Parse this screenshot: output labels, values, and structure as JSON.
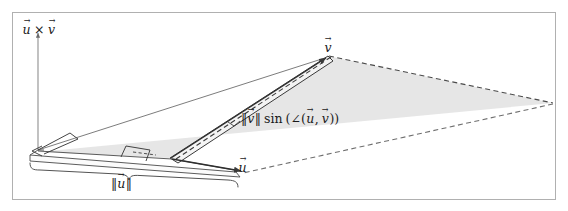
{
  "figure": {
    "frame": {
      "border_color": "#b0b0b0",
      "background_color": "#ffffff"
    },
    "palette": {
      "plane_fill": "#dcdcdc",
      "blade_fill": "#f2f2f2",
      "slab_fill": "#fafafa",
      "stroke": "#3a3a3a",
      "dashed_stroke": "#4a4a4a",
      "axis_stroke": "#8a8a8a",
      "text": "#1a1a1a"
    },
    "labels": {
      "cross_product": {
        "name": "cross-product-axis-label",
        "u": "u",
        "operator": "×",
        "v": "v",
        "plain": "u⃗ × v⃗"
      },
      "v_apex": {
        "name": "vector-v-label",
        "v": "v",
        "plain": "v⃗"
      },
      "height": {
        "name": "height-expression-label",
        "bar_open": "‖",
        "v": "v",
        "bar_close": "‖",
        "sin": "sin",
        "paren_open": "(",
        "angle_sym": "∠",
        "inner_open": "(",
        "u": "u",
        "comma": ",",
        "v2": "v",
        "inner_close": ")",
        "paren_close": ")",
        "plain": "‖v⃗‖ sin (∠(u⃗, v⃗))"
      },
      "u_vector": {
        "name": "vector-u-label",
        "u": "u",
        "plain": "u⃗"
      },
      "u_norm": {
        "name": "u-magnitude-brace-label",
        "bar_open": "‖",
        "u": "u",
        "bar_close": "‖",
        "plain": "‖u⃗‖"
      }
    },
    "geometry": {
      "description": "Perspective view of the parallelogram spanned by vectors u and v, with the cross product u x v drawn as a vertical axis perpendicular to the plane.",
      "plane_vertices": [
        [
          38,
          152
        ],
        [
          170,
          158
        ],
        [
          328,
          56
        ],
        [
          553,
          103
        ]
      ],
      "axis_line": [
        [
          38,
          30
        ],
        [
          38,
          152
        ]
      ],
      "v_vector": [
        [
          170,
          158
        ],
        [
          328,
          56
        ]
      ],
      "u_vector": [
        [
          170,
          158
        ],
        [
          240,
          170
        ]
      ],
      "right_angle_markers": [
        "axis-plane-corner",
        "height-foot-corner"
      ]
    }
  }
}
